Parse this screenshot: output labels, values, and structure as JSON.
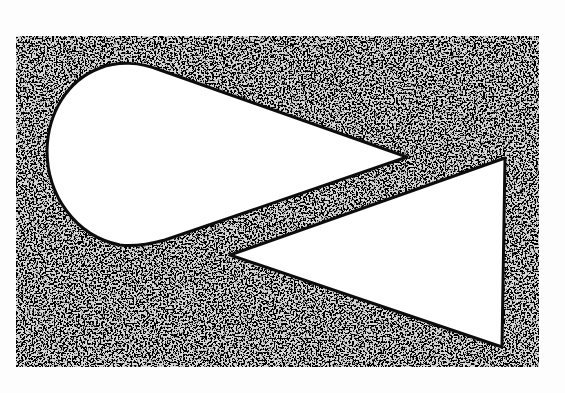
{
  "figure": {
    "background_color": "#fdfdfd",
    "texture": {
      "name": "stipple-texture",
      "dark_color": "#1a1a1a",
      "light_color": "#d8d8d8"
    },
    "rectangle": {
      "x": 16,
      "y": 36,
      "width": 523,
      "height": 331
    },
    "shapes": [
      {
        "name": "teardrop",
        "fill": "#ffffff",
        "outline": "#0d0d0d",
        "tip": [
          407,
          157
        ],
        "leftmost": [
          47,
          153
        ],
        "top": [
          130,
          63
        ],
        "bottom": [
          123,
          245
        ]
      },
      {
        "name": "triangle",
        "fill": "#ffffff",
        "outline": "#0d0d0d",
        "vertices": [
          [
            230,
            255
          ],
          [
            505,
            158
          ],
          [
            502,
            347
          ]
        ]
      }
    ]
  }
}
